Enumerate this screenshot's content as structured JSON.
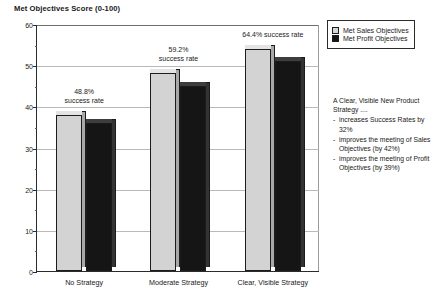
{
  "chart_data": {
    "type": "bar",
    "title": "Met Objectives Score (0-100)",
    "xlabel": "",
    "ylabel": "",
    "ylim": [
      0,
      60
    ],
    "yticks": [
      0,
      10,
      20,
      30,
      40,
      50,
      60
    ],
    "yminor_step": 5,
    "grid": true,
    "legend_position": "top-right",
    "categories": [
      "No Strategy",
      "Moderate Strategy",
      "Clear, Visible Strategy"
    ],
    "series": [
      {
        "name": "Met Sales Objectives",
        "color": "#d3d3d3",
        "values": [
          38,
          48,
          54
        ]
      },
      {
        "name": "Met Profit Objectives",
        "color": "#151515",
        "values": [
          36,
          45,
          51
        ]
      }
    ],
    "annotations": [
      {
        "category": "No Strategy",
        "text": "48.8%\nsuccess rate"
      },
      {
        "category": "Moderate Strategy",
        "text": "59.2%\nsuccess rate"
      },
      {
        "category": "Clear, Visible Strategy",
        "text": "64.4% success rate"
      }
    ]
  },
  "legend": {
    "items": [
      {
        "label": "Met Sales Objectives",
        "swatch": "light"
      },
      {
        "label": "Met Profit Objectives",
        "swatch": "dark"
      }
    ]
  },
  "side_note": {
    "headline": "A Clear, Visible New Product Strategy ....",
    "bullets": [
      "increases Success Rates by 32%",
      "improves the meeting of Sales  Objectives  (by 42%)",
      "improves the meeting of Profit Objectives (by 39%)"
    ]
  }
}
